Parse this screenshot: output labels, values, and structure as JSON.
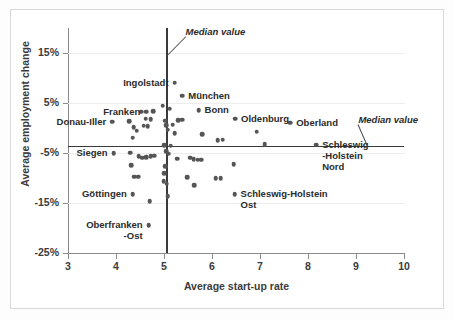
{
  "chart_data": {
    "type": "scatter",
    "title": "",
    "xlabel": "Average  start-up rate",
    "ylabel": "Average employment change",
    "xlim": [
      3,
      10
    ],
    "ylim": [
      -25,
      20
    ],
    "xticks": [
      "3",
      "4",
      "5",
      "6",
      "7",
      "8",
      "9",
      "10"
    ],
    "yticks": [
      "15%",
      "5%",
      "-5%",
      "-15%",
      "-25%"
    ],
    "ytick_values": [
      15,
      5,
      -5,
      -15,
      -25
    ],
    "grid": "horizontal",
    "legend": "none",
    "median_x": 5.05,
    "median_y": -3.6,
    "annotations": [
      {
        "name": "median-vertical-caption",
        "text": "Median value",
        "x": 5.45,
        "y": 19.2
      },
      {
        "name": "median-horizontal-caption",
        "text": "Median value",
        "x": 9.05,
        "y": 1.6
      }
    ],
    "points": [
      {
        "label": "Ingolstadt",
        "x": 5.22,
        "y": 9.1,
        "label_side": "left"
      },
      {
        "label": "München",
        "x": 5.38,
        "y": 6.5,
        "label_side": "right"
      },
      {
        "label": "Bonn",
        "x": 5.72,
        "y": 3.6,
        "label_side": "right"
      },
      {
        "label": "Franken",
        "x": 4.63,
        "y": 3.3,
        "label_side": "left"
      },
      {
        "label": "Donau-Iller",
        "x": 3.92,
        "y": 1.3,
        "label_side": "left"
      },
      {
        "label": "Oldenburg",
        "x": 6.48,
        "y": 1.9,
        "label_side": "right"
      },
      {
        "label": "Oberland",
        "x": 7.63,
        "y": 1.1,
        "label_side": "right"
      },
      {
        "label": "Schleswig -Holstein Nord",
        "x": 8.17,
        "y": -3.3,
        "label_side": "right"
      },
      {
        "label": "Siegen",
        "x": 3.95,
        "y": -5.0,
        "label_side": "left"
      },
      {
        "label": "Göttingen",
        "x": 4.35,
        "y": -13.2,
        "label_side": "left"
      },
      {
        "label": "Oberfranken -Ost",
        "x": 4.68,
        "y": -19.4,
        "label_side": "left"
      },
      {
        "label": "Schleswig-Holstein Ost",
        "x": 6.47,
        "y": -13.2,
        "label_side": "right"
      },
      {
        "label": "",
        "x": 4.28,
        "y": 1.4
      },
      {
        "label": "",
        "x": 4.35,
        "y": -1.9
      },
      {
        "label": "",
        "x": 4.52,
        "y": 3.3
      },
      {
        "label": "",
        "x": 4.78,
        "y": 3.4
      },
      {
        "label": "",
        "x": 4.62,
        "y": 1.9
      },
      {
        "label": "",
        "x": 4.72,
        "y": 1.8
      },
      {
        "label": "",
        "x": 4.58,
        "y": 0.5
      },
      {
        "label": "",
        "x": 4.66,
        "y": 0.4
      },
      {
        "label": "",
        "x": 4.37,
        "y": 0.2
      },
      {
        "label": "",
        "x": 4.43,
        "y": -0.5
      },
      {
        "label": "",
        "x": 4.3,
        "y": -4.9
      },
      {
        "label": "",
        "x": 4.47,
        "y": -5.6
      },
      {
        "label": "",
        "x": 4.55,
        "y": -5.9
      },
      {
        "label": "",
        "x": 4.63,
        "y": -5.8
      },
      {
        "label": "",
        "x": 4.72,
        "y": -5.6
      },
      {
        "label": "",
        "x": 4.8,
        "y": -5.5
      },
      {
        "label": "",
        "x": 4.32,
        "y": -7.4
      },
      {
        "label": "",
        "x": 4.38,
        "y": -9.7
      },
      {
        "label": "",
        "x": 4.46,
        "y": -9.7
      },
      {
        "label": "",
        "x": 4.7,
        "y": -14.6
      },
      {
        "label": "",
        "x": 4.97,
        "y": 4.5
      },
      {
        "label": "",
        "x": 5.12,
        "y": 3.9
      },
      {
        "label": "",
        "x": 5.02,
        "y": 1.5
      },
      {
        "label": "",
        "x": 5.3,
        "y": 1.6
      },
      {
        "label": "",
        "x": 5.38,
        "y": 1.7
      },
      {
        "label": "",
        "x": 5.05,
        "y": 0.6
      },
      {
        "label": "",
        "x": 5.18,
        "y": 0.7
      },
      {
        "label": "",
        "x": 5.08,
        "y": -0.3
      },
      {
        "label": "",
        "x": 5.22,
        "y": -1.0
      },
      {
        "label": "",
        "x": 5.01,
        "y": -3.4
      },
      {
        "label": "",
        "x": 5.14,
        "y": -3.5
      },
      {
        "label": "",
        "x": 5.05,
        "y": -4.6
      },
      {
        "label": "",
        "x": 5.1,
        "y": -5.1
      },
      {
        "label": "",
        "x": 5.27,
        "y": -6.1
      },
      {
        "label": "",
        "x": 5.03,
        "y": -7.6
      },
      {
        "label": "",
        "x": 5.0,
        "y": -9.0
      },
      {
        "label": "",
        "x": 4.99,
        "y": -10.6
      },
      {
        "label": "",
        "x": 5.06,
        "y": -11.1
      },
      {
        "label": "",
        "x": 5.08,
        "y": -13.6
      },
      {
        "label": "",
        "x": 5.55,
        "y": -5.9
      },
      {
        "label": "",
        "x": 5.62,
        "y": -6.2
      },
      {
        "label": "",
        "x": 5.7,
        "y": -6.3
      },
      {
        "label": "",
        "x": 5.78,
        "y": -6.3
      },
      {
        "label": "",
        "x": 5.48,
        "y": -9.8
      },
      {
        "label": "",
        "x": 5.63,
        "y": -11.4
      },
      {
        "label": "",
        "x": 5.8,
        "y": -1.2
      },
      {
        "label": "",
        "x": 6.12,
        "y": -2.4
      },
      {
        "label": "",
        "x": 6.22,
        "y": -2.3
      },
      {
        "label": "",
        "x": 6.08,
        "y": -10.0
      },
      {
        "label": "",
        "x": 6.18,
        "y": -10.0
      },
      {
        "label": "",
        "x": 6.45,
        "y": -7.2
      },
      {
        "label": "",
        "x": 6.93,
        "y": -0.7
      },
      {
        "label": "",
        "x": 7.1,
        "y": -3.2
      }
    ]
  }
}
